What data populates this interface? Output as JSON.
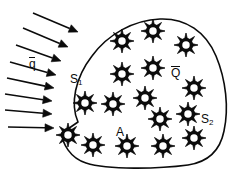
{
  "figure": {
    "width": 244,
    "height": 185,
    "background_color": "#ffffff",
    "line_color": "#0b0b0b",
    "text_color": "#0b0b0b"
  },
  "labels": {
    "flux": {
      "base": "q",
      "overbar": true,
      "text": "q̄",
      "meaning": "prescribed heat flux on boundary"
    },
    "surface_1": {
      "base": "S",
      "subscript": "1",
      "text": "S₁",
      "meaning": "boundary segment with applied flux"
    },
    "surface_2": {
      "base": "S",
      "subscript": "2",
      "text": "S₂",
      "meaning": "remaining boundary segment"
    },
    "generation": {
      "base": "Q",
      "overbar": true,
      "text": "Q̄",
      "meaning": "internal heat generation per unit volume"
    },
    "area": {
      "base": "A",
      "text": "A",
      "meaning": "two-dimensional region / area"
    }
  },
  "region": {
    "name": "blob-region",
    "fill": "#ffffff",
    "stroke": "#0b0b0b",
    "stroke_width": 1.6,
    "path": "M 78 122 C 70 104 75 78 92 56 C 108 34 134 20 160 19 C 186 18 206 32 216 56 C 226 80 229 108 224 131 C 220 151 208 162 188 165 C 158 169 108 170 86 163 C 70 158 62 143 62 133 Z"
  },
  "arrows": {
    "name": "heat-flux-arrows",
    "count": 8,
    "color": "#0b0b0b",
    "shaft_width": 1.6,
    "head_length": 9,
    "head_width": 8,
    "items": [
      {
        "x1": 33,
        "y1": 13,
        "x2": 78,
        "y2": 32
      },
      {
        "x1": 23,
        "y1": 28,
        "x2": 68,
        "y2": 47
      },
      {
        "x1": 16,
        "y1": 45,
        "x2": 61,
        "y2": 61
      },
      {
        "x1": 10,
        "y1": 62,
        "x2": 56,
        "y2": 75
      },
      {
        "x1": 7,
        "y1": 78,
        "x2": 54,
        "y2": 88
      },
      {
        "x1": 5,
        "y1": 94,
        "x2": 52,
        "y2": 101
      },
      {
        "x1": 5,
        "y1": 110,
        "x2": 52,
        "y2": 114
      },
      {
        "x1": 8,
        "y1": 127,
        "x2": 54,
        "y2": 128
      }
    ]
  },
  "sources": {
    "name": "heat-source-stars",
    "count": 19,
    "symbol": "eight-point-star-with-hollow-center",
    "stroke": "#0b0b0b",
    "fill": "#0b0b0b",
    "core_fill": "#ffffff",
    "points": 8,
    "items": [
      {
        "cx": 122,
        "cy": 41,
        "r": 12
      },
      {
        "cx": 153,
        "cy": 31,
        "r": 12
      },
      {
        "cx": 186,
        "cy": 45,
        "r": 12
      },
      {
        "cx": 122,
        "cy": 74,
        "r": 12
      },
      {
        "cx": 153,
        "cy": 68,
        "r": 12
      },
      {
        "cx": 194,
        "cy": 88,
        "r": 12
      },
      {
        "cx": 85,
        "cy": 103,
        "r": 12
      },
      {
        "cx": 113,
        "cy": 104,
        "r": 12
      },
      {
        "cx": 145,
        "cy": 98,
        "r": 12
      },
      {
        "cx": 188,
        "cy": 114,
        "r": 12
      },
      {
        "cx": 160,
        "cy": 119,
        "r": 12
      },
      {
        "cx": 68,
        "cy": 135,
        "r": 12
      },
      {
        "cx": 93,
        "cy": 145,
        "r": 12
      },
      {
        "cx": 127,
        "cy": 146,
        "r": 12
      },
      {
        "cx": 163,
        "cy": 146,
        "r": 12
      },
      {
        "cx": 194,
        "cy": 138,
        "r": 12
      },
      {
        "cx": 104,
        "cy": 62,
        "r": 0
      },
      {
        "cx": 0,
        "cy": 0,
        "r": 0
      },
      {
        "cx": 0,
        "cy": 0,
        "r": 0
      }
    ]
  }
}
